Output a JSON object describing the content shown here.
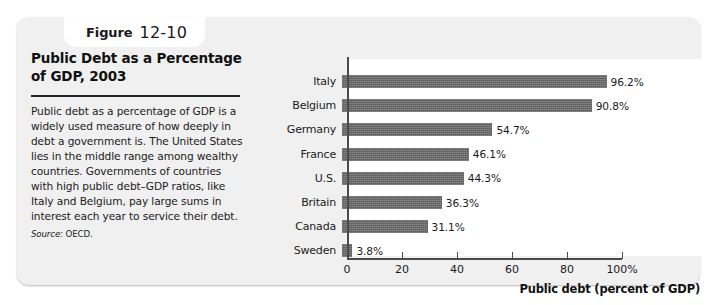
{
  "figure": {
    "label": "Figure",
    "number": "12-10"
  },
  "caption": {
    "title": "Public Debt as a Percentage of GDP, 2003",
    "body": "Public debt as a percentage of GDP is a widely used measure of how deeply in debt a government is. The United States lies in the middle range among wealthy countries. Governments of countries with high public debt–GDP ratios, like Italy and Belgium, pay large sums in interest each year to service their debt.",
    "source_label": "Source:",
    "source_value": "OECD."
  },
  "colors": {
    "bar": "#5c5c5c",
    "panel": "#f0f0f0",
    "plot": "#ffffff",
    "axis": "#4a4a4a",
    "text": "#1a1a1a"
  },
  "chart_data": {
    "type": "bar",
    "orientation": "horizontal",
    "title": "Public Debt as a Percentage of GDP, 2003",
    "xlabel": "Public debt (percent of GDP)",
    "ylabel": "",
    "xlim": [
      0,
      100
    ],
    "grid": false,
    "legend": false,
    "xticks": [
      0,
      20,
      40,
      60,
      80,
      100
    ],
    "xticklabels": [
      "0",
      "20",
      "40",
      "60",
      "80",
      "100%"
    ],
    "categories": [
      "Italy",
      "Belgium",
      "Germany",
      "France",
      "U.S.",
      "Britain",
      "Canada",
      "Sweden"
    ],
    "values": [
      96.2,
      90.8,
      54.7,
      46.1,
      44.3,
      36.3,
      31.1,
      3.8
    ],
    "datalabels": [
      "96.2%",
      "90.8%",
      "54.7%",
      "46.1%",
      "44.3%",
      "36.3%",
      "31.1%",
      "3.8%"
    ]
  }
}
